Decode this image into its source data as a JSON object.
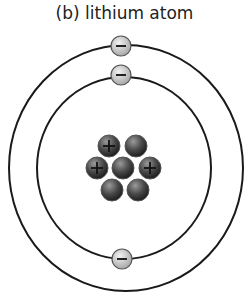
{
  "title": "(b) lithium atom",
  "atom": {
    "element": "lithium",
    "protons": 3,
    "neutrons": 4,
    "electrons": 3,
    "shells": [
      {
        "name": "inner",
        "electrons": 2
      },
      {
        "name": "outer",
        "electrons": 1
      }
    ]
  },
  "symbols": {
    "proton": "+",
    "electron": "−"
  },
  "colors": {
    "orbit": "#1a1a1a",
    "electron_fill": "#c8c8c8",
    "nucleon_dark": "#3a3a3a"
  }
}
